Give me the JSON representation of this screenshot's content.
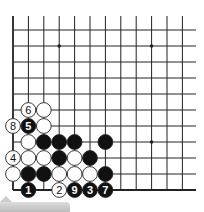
{
  "diagram": {
    "type": "go-board-corner",
    "grid": {
      "origin_x": 13,
      "origin_y": 30,
      "col_spacing": 15.4,
      "row_spacing": 16,
      "cols": 13,
      "rows": 11,
      "left_edge": true,
      "bottom_edge": true,
      "line_color": "#222222"
    },
    "star_points": [
      {
        "col": 3,
        "row": 1
      },
      {
        "col": 9,
        "row": 1
      },
      {
        "col": 9,
        "row": 7
      }
    ],
    "stones": [
      {
        "col": 1,
        "row": 5,
        "color": "white",
        "label": "6"
      },
      {
        "col": 2,
        "row": 5,
        "color": "white",
        "label": ""
      },
      {
        "col": 0,
        "row": 6,
        "color": "white",
        "label": "8"
      },
      {
        "col": 1,
        "row": 6,
        "color": "black",
        "label": "5"
      },
      {
        "col": 2,
        "row": 6,
        "color": "white",
        "label": ""
      },
      {
        "col": 1,
        "row": 7,
        "color": "white",
        "label": ""
      },
      {
        "col": 2,
        "row": 7,
        "color": "black",
        "label": ""
      },
      {
        "col": 3,
        "row": 7,
        "color": "black",
        "label": ""
      },
      {
        "col": 4,
        "row": 7,
        "color": "black",
        "label": ""
      },
      {
        "col": 6,
        "row": 7,
        "color": "black",
        "label": ""
      },
      {
        "col": 0,
        "row": 8,
        "color": "white",
        "label": "4"
      },
      {
        "col": 1,
        "row": 8,
        "color": "white",
        "label": ""
      },
      {
        "col": 2,
        "row": 8,
        "color": "white",
        "label": ""
      },
      {
        "col": 3,
        "row": 8,
        "color": "black",
        "label": ""
      },
      {
        "col": 4,
        "row": 8,
        "color": "white",
        "label": ""
      },
      {
        "col": 5,
        "row": 8,
        "color": "black",
        "label": ""
      },
      {
        "col": 0,
        "row": 9,
        "color": "white",
        "label": ""
      },
      {
        "col": 1,
        "row": 9,
        "color": "black",
        "label": ""
      },
      {
        "col": 2,
        "row": 9,
        "color": "black",
        "label": ""
      },
      {
        "col": 3,
        "row": 9,
        "color": "white",
        "label": ""
      },
      {
        "col": 4,
        "row": 9,
        "color": "white",
        "label": ""
      },
      {
        "col": 5,
        "row": 9,
        "color": "white",
        "label": ""
      },
      {
        "col": 6,
        "row": 9,
        "color": "black",
        "label": ""
      },
      {
        "col": 1,
        "row": 10,
        "color": "black",
        "label": "1"
      },
      {
        "col": 3,
        "row": 10,
        "color": "white",
        "label": "2"
      },
      {
        "col": 4,
        "row": 10,
        "color": "black",
        "label": "9"
      },
      {
        "col": 5,
        "row": 10,
        "color": "black",
        "label": "3"
      },
      {
        "col": 6,
        "row": 10,
        "color": "black",
        "label": "7"
      }
    ],
    "colors": {
      "black_stone": "#111111",
      "white_stone": "#ffffff",
      "stone_outline": "#222222"
    }
  }
}
